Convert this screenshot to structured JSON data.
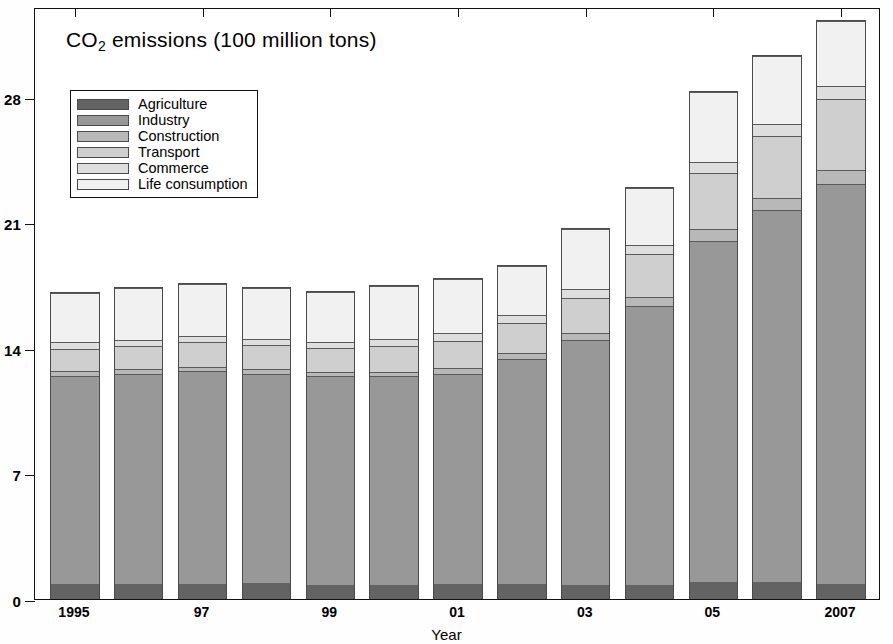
{
  "chart_data": {
    "type": "bar",
    "subtype": "stacked-bar",
    "title": "CO2 emissions (100 million tons)",
    "title_parts": {
      "before": "CO",
      "sub": "2",
      "after": " emissions (100 million tons)"
    },
    "xlabel": "Year",
    "ylabel": "",
    "ylim": [
      0,
      33
    ],
    "yticks": [
      0,
      7,
      14,
      21,
      28
    ],
    "ytick_labels": [
      "0",
      "7",
      "14",
      "21",
      "28"
    ],
    "grid": false,
    "legend_position": "upper-left inside",
    "categories": [
      "1995",
      "1996",
      "1997",
      "1998",
      "1999",
      "2000",
      "2001",
      "2002",
      "2003",
      "2004",
      "2005",
      "2006",
      "2007"
    ],
    "xtick_labels": [
      "1995",
      "",
      "97",
      "",
      "99",
      "",
      "01",
      "",
      "03",
      "",
      "05",
      "",
      "2007"
    ],
    "series": [
      {
        "name": "Agriculture",
        "color": "#636363",
        "values": [
          0.85,
          0.85,
          0.85,
          0.9,
          0.8,
          0.8,
          0.85,
          0.85,
          0.8,
          0.8,
          0.95,
          0.95,
          0.85
        ]
      },
      {
        "name": "Industry",
        "color": "#989898",
        "values": [
          11.65,
          11.75,
          11.9,
          11.7,
          11.65,
          11.65,
          11.75,
          12.55,
          13.65,
          15.55,
          19.05,
          20.75,
          22.35
        ]
      },
      {
        "name": "Construction",
        "color": "#b8b8b8",
        "values": [
          0.25,
          0.25,
          0.25,
          0.25,
          0.25,
          0.25,
          0.3,
          0.35,
          0.4,
          0.5,
          0.65,
          0.7,
          0.75
        ]
      },
      {
        "name": "Transport",
        "color": "#cfcfcf",
        "values": [
          1.25,
          1.3,
          1.35,
          1.35,
          1.35,
          1.45,
          1.55,
          1.7,
          2.0,
          2.4,
          3.15,
          3.45,
          3.95
        ]
      },
      {
        "name": "Commerce",
        "color": "#dedede",
        "values": [
          0.35,
          0.35,
          0.35,
          0.35,
          0.35,
          0.4,
          0.4,
          0.45,
          0.5,
          0.55,
          0.6,
          0.7,
          0.75
        ]
      },
      {
        "name": "Life consumption",
        "color": "#f1f1f1",
        "values": [
          2.75,
          2.9,
          2.9,
          2.85,
          2.75,
          2.95,
          3.05,
          2.7,
          3.35,
          3.15,
          3.9,
          3.75,
          3.65
        ]
      }
    ],
    "totals": [
      17.1,
      17.4,
      17.6,
      17.4,
      17.15,
      17.5,
      17.9,
      18.6,
      20.7,
      22.95,
      28.3,
      30.3,
      32.3
    ]
  },
  "legend": {
    "items": [
      {
        "label": "Agriculture"
      },
      {
        "label": "Industry"
      },
      {
        "label": "Construction"
      },
      {
        "label": "Transport"
      },
      {
        "label": "Commerce"
      },
      {
        "label": "Life consumption"
      }
    ]
  }
}
